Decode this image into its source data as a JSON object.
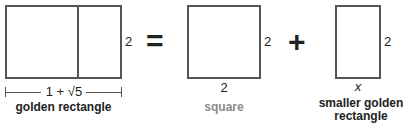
{
  "golden_rectangle": {
    "height_label": "2",
    "width_label": "1 + √5",
    "caption": "golden rectangle"
  },
  "equals_sign": "=",
  "square": {
    "height_label": "2",
    "width_label": "2",
    "caption": "square",
    "caption_color": "#8a8a8a"
  },
  "plus_sign": "+",
  "smaller_golden_rectangle": {
    "height_label": "2",
    "width_label": "x",
    "caption_line1": "smaller golden",
    "caption_line2": "rectangle"
  }
}
